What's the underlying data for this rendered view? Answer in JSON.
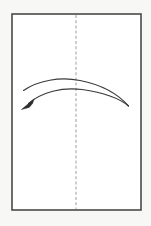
{
  "figure": {
    "kind": "origami-fold-step-diagram",
    "canvas": {
      "width": 151,
      "height": 226,
      "background": "#f7f7f6"
    },
    "paper": {
      "name": "paper-sheet",
      "shape": "rectangle",
      "x": 12,
      "y": 14,
      "width": 129,
      "height": 196,
      "fill": "#ffffff",
      "stroke": "#4a4a4a",
      "stroke_width": 1.6
    },
    "crease": {
      "name": "vertical-center-crease",
      "type": "valley-fold-dashed",
      "orientation": "vertical",
      "x": 76,
      "y_start": 15,
      "y_end": 209,
      "color": "#a8a8a8",
      "dash": "3 2.2"
    },
    "arrow": {
      "name": "fold-over-arrow",
      "direction": "right-to-left",
      "color": "#3a3a3a",
      "upper_arc": "M 23.5 90.5 C 38 80.5 60 76.5 80 80.5 C 103 85 118 94 128.5 106",
      "lower_arc": "M 28.5 103.5 C 42 92 62 87 82 89.5 C 103 92.5 118.5 97.5 128.5 106",
      "head_points": "21.5,109.5 33.5,99.5 32,103.6 28.5,107.2",
      "tip_x": 21.5,
      "tip_y": 109.5
    }
  },
  "labels": {
    "caption": ""
  }
}
